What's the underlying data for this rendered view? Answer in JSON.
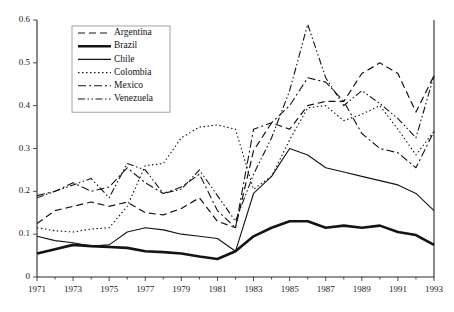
{
  "chart_data": {
    "type": "line",
    "title": "",
    "xlabel": "",
    "ylabel": "",
    "xlim": [
      1971,
      1993
    ],
    "ylim": [
      0,
      0.6
    ],
    "grid": false,
    "legend_position": "top-left-inside",
    "x": [
      1971,
      1972,
      1973,
      1974,
      1975,
      1976,
      1977,
      1978,
      1979,
      1980,
      1981,
      1982,
      1983,
      1984,
      1985,
      1986,
      1987,
      1988,
      1989,
      1990,
      1991,
      1992,
      1993
    ],
    "y_ticks": [
      "0",
      "0.1",
      "0.2",
      "0.3",
      "0.4",
      "0.5",
      "0.6"
    ],
    "y_tick_values": [
      0,
      0.1,
      0.2,
      0.3,
      0.4,
      0.5,
      0.6
    ],
    "x_ticks": [
      "1971",
      "1973",
      "1975",
      "1977",
      "1979",
      "1981",
      "1983",
      "1985",
      "1987",
      "1989",
      "1991",
      "1993"
    ],
    "x_tick_values": [
      1971,
      1973,
      1975,
      1977,
      1979,
      1981,
      1983,
      1985,
      1987,
      1989,
      1991,
      1993
    ],
    "x_minor_ticks": [
      1972,
      1974,
      1976,
      1978,
      1980,
      1982,
      1984,
      1986,
      1988,
      1990,
      1992
    ],
    "series": [
      {
        "name": "Argentina",
        "dash": "7,4",
        "width": 1.2,
        "values": [
          0.125,
          0.155,
          0.165,
          0.175,
          0.165,
          0.175,
          0.15,
          0.145,
          0.16,
          0.185,
          0.13,
          0.115,
          0.295,
          0.36,
          0.345,
          0.4,
          0.41,
          0.41,
          0.475,
          0.5,
          0.475,
          0.385,
          0.47
        ]
      },
      {
        "name": "Brazil",
        "dash": "0",
        "width": 2.6,
        "values": [
          0.055,
          0.065,
          0.075,
          0.072,
          0.07,
          0.068,
          0.06,
          0.058,
          0.055,
          0.048,
          0.042,
          0.06,
          0.095,
          0.115,
          0.13,
          0.13,
          0.115,
          0.12,
          0.115,
          0.12,
          0.105,
          0.098,
          0.075
        ]
      },
      {
        "name": "Chile",
        "dash": "0",
        "width": 1.1,
        "values": [
          0.095,
          0.085,
          0.08,
          0.072,
          0.075,
          0.105,
          0.115,
          0.11,
          0.1,
          0.095,
          0.09,
          0.06,
          0.195,
          0.235,
          0.3,
          0.285,
          0.255,
          0.245,
          0.235,
          0.225,
          0.215,
          0.195,
          0.155
        ]
      },
      {
        "name": "Colombia",
        "dash": "1.5,2.5",
        "width": 1.1,
        "values": [
          0.115,
          0.108,
          0.105,
          0.112,
          0.115,
          0.165,
          0.26,
          0.265,
          0.325,
          0.35,
          0.355,
          0.345,
          0.205,
          0.235,
          0.32,
          0.395,
          0.4,
          0.365,
          0.38,
          0.4,
          0.345,
          0.285,
          0.34
        ]
      },
      {
        "name": "Mexico",
        "dash": "8,3,2,3",
        "width": 1.1,
        "values": [
          0.19,
          0.2,
          0.22,
          0.2,
          0.21,
          0.255,
          0.22,
          0.195,
          0.21,
          0.24,
          0.155,
          0.115,
          0.345,
          0.36,
          0.4,
          0.465,
          0.455,
          0.41,
          0.335,
          0.3,
          0.29,
          0.255,
          0.34
        ]
      },
      {
        "name": "Venezuela",
        "dash": "7,2.5,1.5,2.5,1.5,2.5",
        "width": 1.1,
        "values": [
          0.185,
          0.2,
          0.215,
          0.23,
          0.185,
          0.265,
          0.25,
          0.195,
          0.205,
          0.25,
          0.19,
          0.13,
          0.24,
          0.325,
          0.435,
          0.59,
          0.465,
          0.4,
          0.435,
          0.405,
          0.37,
          0.325,
          0.47
        ]
      }
    ]
  },
  "legend": {
    "items": [
      {
        "label": "Argentina"
      },
      {
        "label": "Brazil"
      },
      {
        "label": "Chile"
      },
      {
        "label": "Colombia"
      },
      {
        "label": "Mexico"
      },
      {
        "label": "Venezuela"
      }
    ]
  }
}
